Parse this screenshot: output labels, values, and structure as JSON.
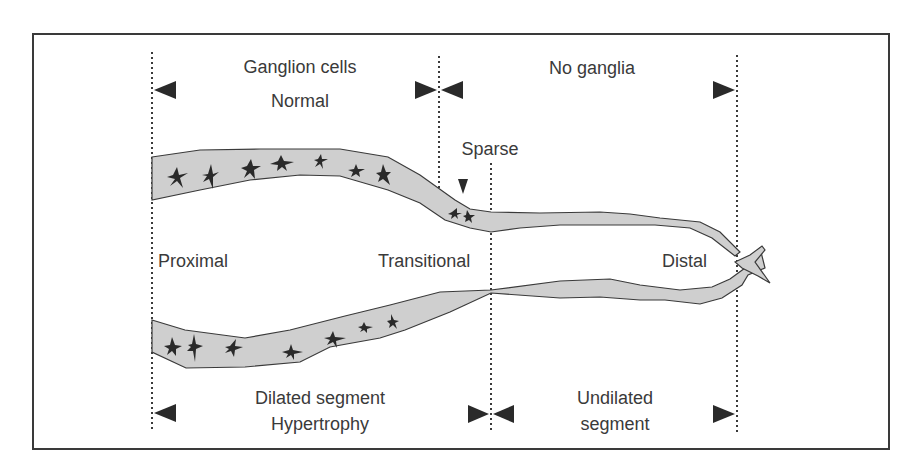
{
  "diagram": {
    "type": "schematic",
    "top_labels": {
      "ganglion_cells": "Ganglion cells",
      "normal": "Normal",
      "no_ganglia": "No ganglia"
    },
    "marker_label": "Sparse",
    "region_labels": {
      "proximal": "Proximal",
      "transitional": "Transitional",
      "distal": "Distal"
    },
    "bottom_labels": {
      "dilated_segment": "Dilated segment",
      "hypertrophy": "Hypertrophy",
      "undilated": "Undilated",
      "segment": "segment"
    },
    "colors": {
      "wall_fill": "#cfcfcf",
      "outline": "#3a3a3a",
      "cells": "#2a2a2a",
      "background": "#ffffff"
    }
  }
}
